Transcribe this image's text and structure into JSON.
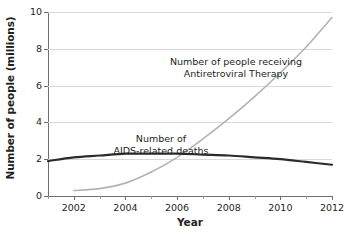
{
  "chart_data": {
    "type": "line",
    "title": "",
    "xlabel": "Year",
    "ylabel": "Number of people (millions)",
    "xlim": [
      2001,
      2012
    ],
    "ylim": [
      0,
      10
    ],
    "yticks": [
      0,
      2,
      4,
      6,
      8,
      10
    ],
    "ytick_labels": [
      "0",
      "2",
      "4",
      "6",
      "8",
      "10"
    ],
    "xticks": [
      2002,
      2004,
      2006,
      2008,
      2010,
      2012
    ],
    "xtick_labels": [
      "2002",
      "2004",
      "2006",
      "2008",
      "2010",
      "2012"
    ],
    "x_minor_ticks": [
      2001,
      2003,
      2005,
      2007,
      2009,
      2011
    ],
    "grid": "horizontal",
    "legend_position": "inline-annotations",
    "series": [
      {
        "name": "Number of people receiving Antiretroviral Therapy",
        "color": "#b3b3b3",
        "width": 1.6,
        "x": [
          2002,
          2003,
          2004,
          2005,
          2006,
          2007,
          2008,
          2009,
          2010,
          2011,
          2012
        ],
        "values": [
          0.3,
          0.4,
          0.7,
          1.3,
          2.1,
          3.1,
          4.2,
          5.4,
          6.7,
          8.1,
          9.7
        ]
      },
      {
        "name": "Number of AIDS-related deaths",
        "color": "#2b2b2b",
        "width": 2.2,
        "x": [
          2001,
          2002,
          2003,
          2004,
          2005,
          2006,
          2007,
          2008,
          2009,
          2010,
          2011,
          2012
        ],
        "values": [
          1.9,
          2.1,
          2.2,
          2.3,
          2.3,
          2.3,
          2.25,
          2.2,
          2.1,
          2.0,
          1.85,
          1.7
        ]
      }
    ],
    "annotations": [
      {
        "id": "art",
        "text": "Number of people receiving\nAntiretroviral Therapy"
      },
      {
        "id": "deaths",
        "text": "Number of\nAIDS-related deaths"
      }
    ],
    "colors": {
      "axis": "#6d6e71",
      "grid": "#d9d9d9",
      "text": "#231f20",
      "series_art": "#b3b3b3",
      "series_deaths": "#2b2b2b"
    }
  }
}
